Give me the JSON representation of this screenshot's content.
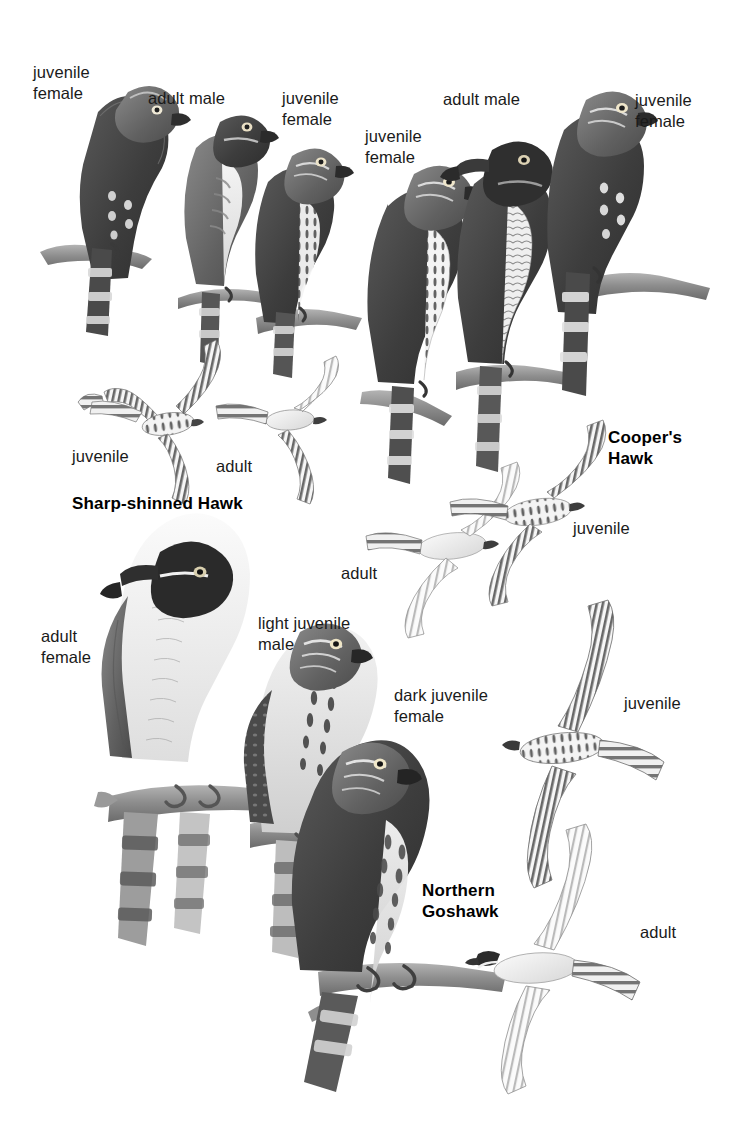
{
  "plate": {
    "title": "Accipiter Hawks",
    "background_color": "#ffffff",
    "text_color": "#1a1a1a",
    "species_text_color": "#000000",
    "width": 735,
    "height": 1141
  },
  "species": [
    {
      "name": "Sharp-shinned Hawk",
      "name_lines": "Sharp-shinned Hawk",
      "bold_label": {
        "x": 72,
        "y": 494
      },
      "figures": [
        {
          "id": "ssh-juv-female-perched",
          "label": "juvenile\nfemale",
          "pose": "perched",
          "label_x": 33,
          "label_y": 62,
          "align": "left"
        },
        {
          "id": "ssh-adult-male-perched",
          "label": "adult male",
          "pose": "perched",
          "label_x": 148,
          "label_y": 88,
          "align": "left"
        },
        {
          "id": "ssh-juv-female-perched-2",
          "label": "juvenile\nfemale",
          "pose": "perched",
          "label_x": 282,
          "label_y": 88,
          "align": "left"
        },
        {
          "id": "ssh-juvenile-flight",
          "label": "juvenile",
          "pose": "flight",
          "label_x": 72,
          "label_y": 446,
          "align": "left"
        },
        {
          "id": "ssh-adult-flight",
          "label": "adult",
          "pose": "flight",
          "label_x": 216,
          "label_y": 456,
          "align": "left"
        }
      ]
    },
    {
      "name": "Cooper's Hawk",
      "name_lines": "Cooper's\nHawk",
      "bold_label": {
        "x": 608,
        "y": 428
      },
      "figures": [
        {
          "id": "coh-juv-female-perched",
          "label": "juvenile\nfemale",
          "pose": "perched",
          "label_x": 365,
          "label_y": 126,
          "align": "left"
        },
        {
          "id": "coh-adult-male-perched",
          "label": "adult male",
          "pose": "perched",
          "label_x": 443,
          "label_y": 89,
          "align": "left"
        },
        {
          "id": "coh-juv-female-perched-2",
          "label": "juvenile\nfemale",
          "pose": "perched",
          "label_x": 635,
          "label_y": 90,
          "align": "left"
        },
        {
          "id": "coh-adult-flight",
          "label": "adult",
          "pose": "flight",
          "label_x": 341,
          "label_y": 563,
          "align": "left"
        },
        {
          "id": "coh-juvenile-flight",
          "label": "juvenile",
          "pose": "flight",
          "label_x": 573,
          "label_y": 518,
          "align": "left"
        }
      ]
    },
    {
      "name": "Northern Goshawk",
      "name_lines": "Northern\nGoshawk",
      "bold_label": {
        "x": 422,
        "y": 881
      },
      "figures": [
        {
          "id": "ngo-adult-female-perched",
          "label": "adult\nfemale",
          "pose": "perched",
          "label_x": 41,
          "label_y": 626,
          "align": "left"
        },
        {
          "id": "ngo-light-juv-male-perched",
          "label": "light juvenile\nmale",
          "pose": "perched",
          "label_x": 258,
          "label_y": 613,
          "align": "left"
        },
        {
          "id": "ngo-dark-juv-female-perched",
          "label": "dark juvenile\nfemale",
          "pose": "perched",
          "label_x": 394,
          "label_y": 685,
          "align": "left"
        },
        {
          "id": "ngo-juvenile-flight",
          "label": "juvenile",
          "pose": "flight",
          "label_x": 624,
          "label_y": 693,
          "align": "left"
        },
        {
          "id": "ngo-adult-flight",
          "label": "adult",
          "pose": "flight",
          "label_x": 640,
          "label_y": 922,
          "align": "left"
        }
      ]
    }
  ],
  "labels": {
    "juvenile_female": "juvenile\nfemale",
    "adult_male": "adult male",
    "juvenile": "juvenile",
    "adult": "adult",
    "adult_female": "adult\nfemale",
    "light_juvenile_male": "light juvenile\nmale",
    "dark_juvenile_female": "dark juvenile\nfemale",
    "sharp_shinned_hawk": "Sharp-shinned Hawk",
    "coopers_hawk": "Cooper's\nHawk",
    "northern_goshawk": "Northern\nGoshawk"
  },
  "palette": {
    "ink_dark": "#3a3a3a",
    "ink_mid": "#6e6e6e",
    "ink_light": "#a8a8a8",
    "ink_pale": "#d5d5d5",
    "branch": "#8d8d8d",
    "near_black": "#2b2b2b",
    "white": "#ffffff"
  }
}
